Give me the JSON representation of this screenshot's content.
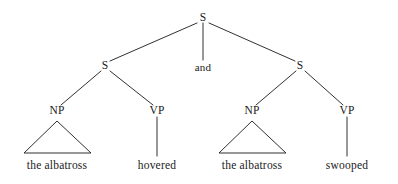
{
  "diagram": {
    "kind": "syntax-tree",
    "background_color": "#ffffff",
    "ink_color": "#1a1a1a",
    "sentence": "the albatross hovered and the albatross swooped",
    "nodes": {
      "root_s": {
        "label": "S",
        "x": 203,
        "y": 18
      },
      "left_s": {
        "label": "S",
        "x": 105,
        "y": 66
      },
      "conjunction": {
        "label": "and",
        "x": 203,
        "y": 67
      },
      "right_s": {
        "label": "S",
        "x": 300,
        "y": 66
      },
      "left_np": {
        "label": "NP",
        "x": 57,
        "y": 111
      },
      "left_vp": {
        "label": "VP",
        "x": 157,
        "y": 111
      },
      "right_np": {
        "label": "NP",
        "x": 252,
        "y": 111
      },
      "right_vp": {
        "label": "VP",
        "x": 347,
        "y": 111
      }
    },
    "terminals": {
      "left_np_text": {
        "label": "the albatross",
        "x": 57,
        "y": 166
      },
      "left_vp_text": {
        "label": "hovered",
        "x": 157,
        "y": 166
      },
      "right_np_text": {
        "label": "the albatross",
        "x": 252,
        "y": 166
      },
      "right_vp_text": {
        "label": "swooped",
        "x": 347,
        "y": 166
      }
    },
    "triangles": [
      {
        "name": "left-np-triangle",
        "apex_x": 57,
        "apex_y": 121,
        "left_x": 24,
        "right_x": 91,
        "base_y": 153
      },
      {
        "name": "right-np-triangle",
        "apex_x": 252,
        "apex_y": 121,
        "left_x": 219,
        "right_x": 286,
        "base_y": 153
      }
    ],
    "edges": [
      {
        "name": "root-to-left-s",
        "x1": 197,
        "y1": 23,
        "x2": 110,
        "y2": 61
      },
      {
        "name": "root-to-conjunction",
        "x1": 203,
        "y1": 23,
        "x2": 203,
        "y2": 60
      },
      {
        "name": "root-to-right-s",
        "x1": 209,
        "y1": 23,
        "x2": 295,
        "y2": 61
      },
      {
        "name": "left-s-to-np",
        "x1": 101,
        "y1": 71,
        "x2": 61,
        "y2": 105
      },
      {
        "name": "left-s-to-vp",
        "x1": 110,
        "y1": 71,
        "x2": 153,
        "y2": 105
      },
      {
        "name": "right-s-to-np",
        "x1": 296,
        "y1": 71,
        "x2": 256,
        "y2": 105
      },
      {
        "name": "right-s-to-vp",
        "x1": 305,
        "y1": 71,
        "x2": 343,
        "y2": 105
      },
      {
        "name": "left-vp-to-word",
        "x1": 157,
        "y1": 117,
        "x2": 157,
        "y2": 156
      },
      {
        "name": "right-vp-to-word",
        "x1": 347,
        "y1": 117,
        "x2": 347,
        "y2": 156
      }
    ]
  }
}
